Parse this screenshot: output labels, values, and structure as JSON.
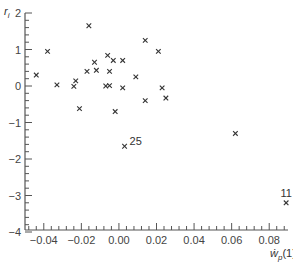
{
  "chart_data": {
    "type": "scatter",
    "title": "",
    "xlabel": "ẇ_p(1)",
    "ylabel": "r_i",
    "xlim": [
      -0.05,
      0.09
    ],
    "ylim": [
      -4,
      2
    ],
    "grid": false,
    "legend": null,
    "x_ticks": [
      -0.04,
      -0.02,
      0.0,
      0.02,
      0.04,
      0.06,
      0.08
    ],
    "x_tick_labels": [
      "−0.04",
      "−0.02",
      "0.00",
      "0.02",
      "0.04",
      "0.06",
      "0.08"
    ],
    "y_ticks": [
      -4,
      -3,
      -2,
      -1,
      0,
      1,
      2
    ],
    "y_tick_labels": [
      "−4",
      "−3",
      "−2",
      "−1",
      "0",
      "1",
      "2"
    ],
    "marker": "x",
    "points": [
      {
        "x": -0.044,
        "y": 0.3
      },
      {
        "x": -0.038,
        "y": 0.95
      },
      {
        "x": -0.033,
        "y": 0.03
      },
      {
        "x": -0.024,
        "y": -0.01
      },
      {
        "x": -0.023,
        "y": 0.14
      },
      {
        "x": -0.021,
        "y": -0.62
      },
      {
        "x": -0.017,
        "y": 0.4
      },
      {
        "x": -0.016,
        "y": 1.65
      },
      {
        "x": -0.013,
        "y": 0.65
      },
      {
        "x": -0.012,
        "y": 0.43
      },
      {
        "x": -0.006,
        "y": 0.84
      },
      {
        "x": -0.007,
        "y": 0.0
      },
      {
        "x": -0.005,
        "y": 0.01
      },
      {
        "x": -0.005,
        "y": 0.4
      },
      {
        "x": -0.003,
        "y": 0.7
      },
      {
        "x": -0.002,
        "y": -0.7
      },
      {
        "x": 0.002,
        "y": 0.7
      },
      {
        "x": 0.002,
        "y": -0.05
      },
      {
        "x": 0.009,
        "y": 0.25
      },
      {
        "x": 0.014,
        "y": 1.25
      },
      {
        "x": 0.014,
        "y": -0.4
      },
      {
        "x": 0.021,
        "y": 0.95
      },
      {
        "x": 0.023,
        "y": -0.05
      },
      {
        "x": 0.025,
        "y": -0.33
      },
      {
        "x": 0.003,
        "y": -1.65,
        "label": "25"
      },
      {
        "x": 0.062,
        "y": -1.3
      },
      {
        "x": 0.089,
        "y": -3.2,
        "label": "11"
      }
    ],
    "annotations": [
      {
        "text": "25",
        "x": 0.003,
        "y": -1.65,
        "position": "right"
      },
      {
        "text": "11",
        "x": 0.089,
        "y": -3.2,
        "position": "above"
      }
    ]
  },
  "colors": {
    "axis": "#555555",
    "marker": "#333333",
    "text": "#444444"
  }
}
